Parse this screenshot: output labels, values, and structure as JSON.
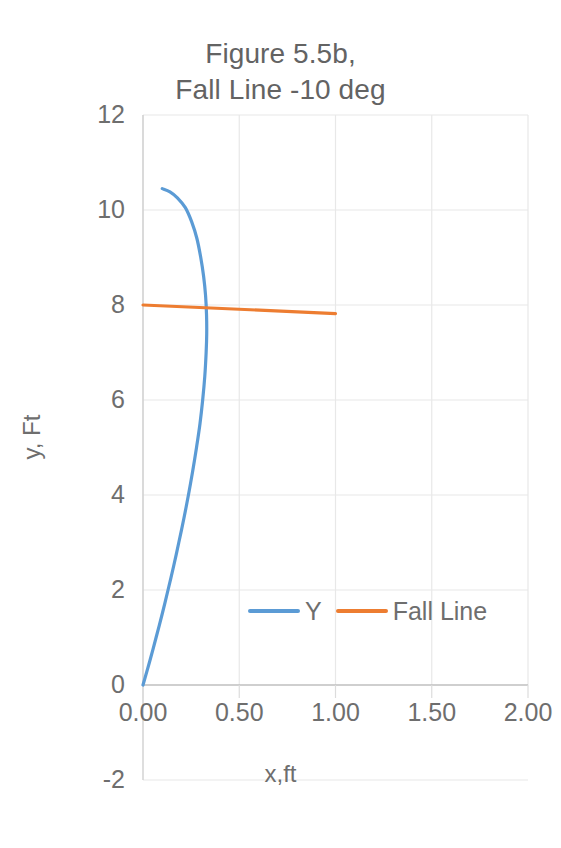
{
  "chart_data": {
    "type": "line",
    "title": "Figure 5.5b,\nFall Line  -10 deg",
    "title_line1": "Figure 5.5b,",
    "title_line2": "Fall Line  -10 deg",
    "xlabel": "x,ft",
    "ylabel": "y, Ft",
    "xlim": [
      0.0,
      2.0
    ],
    "ylim": [
      -2,
      12
    ],
    "xticks": [
      "0.00",
      "0.50",
      "1.00",
      "1.50",
      "2.00"
    ],
    "xtick_values": [
      0.0,
      0.5,
      1.0,
      1.5,
      2.0
    ],
    "yticks": [
      "12",
      "10",
      "8",
      "6",
      "4",
      "2",
      "0",
      "-2"
    ],
    "ytick_values": [
      12,
      10,
      8,
      6,
      4,
      2,
      0,
      -2
    ],
    "grid": true,
    "grid_color": "#e8e8e8",
    "legend_position": "inside-bottom-center",
    "x_axis_crosses_y_at": 0,
    "series": [
      {
        "name": "Y",
        "color": "#5B9BD5",
        "points": [
          [
            0.0,
            0.0
          ],
          [
            0.035,
            0.5
          ],
          [
            0.068,
            1.0
          ],
          [
            0.1,
            1.5
          ],
          [
            0.13,
            2.0
          ],
          [
            0.159,
            2.5
          ],
          [
            0.186,
            3.0
          ],
          [
            0.212,
            3.5
          ],
          [
            0.236,
            4.0
          ],
          [
            0.258,
            4.5
          ],
          [
            0.278,
            5.0
          ],
          [
            0.296,
            5.5
          ],
          [
            0.31,
            6.0
          ],
          [
            0.321,
            6.5
          ],
          [
            0.328,
            7.0
          ],
          [
            0.331,
            7.4
          ],
          [
            0.33,
            7.8
          ],
          [
            0.325,
            8.2
          ],
          [
            0.315,
            8.6
          ],
          [
            0.3,
            9.0
          ],
          [
            0.28,
            9.4
          ],
          [
            0.253,
            9.75
          ],
          [
            0.22,
            10.05
          ],
          [
            0.18,
            10.25
          ],
          [
            0.14,
            10.38
          ],
          [
            0.1,
            10.45
          ]
        ]
      },
      {
        "name": "Fall Line",
        "color": "#ED7D31",
        "points": [
          [
            0.0,
            8.0
          ],
          [
            1.0,
            7.82
          ]
        ]
      }
    ]
  },
  "legend": {
    "entries": [
      {
        "label": "Y",
        "color": "#5B9BD5"
      },
      {
        "label": "Fall Line",
        "color": "#ED7D31"
      }
    ]
  },
  "colors": {
    "series_blue": "#5B9BD5",
    "series_orange": "#ED7D31",
    "text": "#6e6e6e",
    "gridline": "#e8e8e8",
    "axis": "#d9d9d9",
    "background": "#ffffff"
  }
}
